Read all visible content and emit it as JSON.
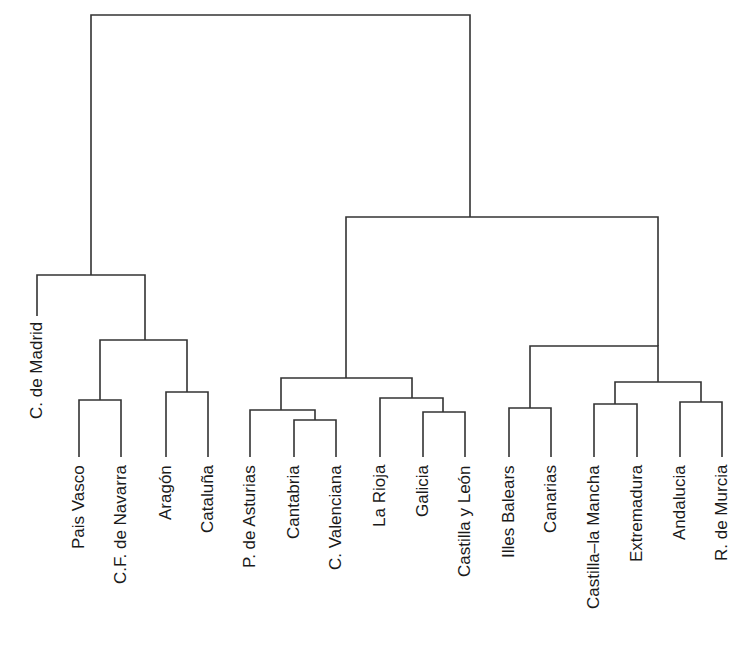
{
  "diagram": {
    "type": "dendrogram",
    "line_color": "#333333",
    "leaves": [
      {
        "label": "C. de Madrid",
        "x": 37,
        "top": 322,
        "bottom": 316
      },
      {
        "label": "Pais Vasco",
        "x": 79,
        "top": 465
      },
      {
        "label": "C.F. de Navarra",
        "x": 121,
        "top": 465
      },
      {
        "label": "Aragón",
        "x": 166,
        "top": 465
      },
      {
        "label": "Cataluña",
        "x": 208,
        "top": 465
      },
      {
        "label": "P. de Asturias",
        "x": 250,
        "top": 465
      },
      {
        "label": "Cantabria",
        "x": 294,
        "top": 465
      },
      {
        "label": "C. Valenciana",
        "x": 336,
        "top": 465
      },
      {
        "label": "La Rioja",
        "x": 380,
        "top": 465
      },
      {
        "label": "Galicia",
        "x": 423,
        "top": 465
      },
      {
        "label": "Castilla y León",
        "x": 465,
        "top": 465
      },
      {
        "label": "Illes Balears",
        "x": 509,
        "top": 465
      },
      {
        "label": "Canarias",
        "x": 551,
        "top": 465
      },
      {
        "label": "Castilla–la Mancha",
        "x": 594,
        "top": 465
      },
      {
        "label": "Extremadura",
        "x": 637,
        "top": 465
      },
      {
        "label": "Andalucia",
        "x": 680,
        "top": 465
      },
      {
        "label": "R. de Murcia",
        "x": 722,
        "top": 465
      }
    ],
    "merges": [
      {
        "left_x": 79,
        "left_y": 457,
        "right_x": 121,
        "right_y": 457,
        "y": 400
      },
      {
        "left_x": 166,
        "left_y": 457,
        "right_x": 208,
        "right_y": 457,
        "y": 392
      },
      {
        "left_x": 100,
        "left_y": 400,
        "right_x": 187,
        "right_y": 392,
        "y": 340
      },
      {
        "left_x": 37,
        "left_y": 316,
        "right_x": 145,
        "right_y": 340,
        "y": 275
      },
      {
        "left_x": 294,
        "left_y": 457,
        "right_x": 336,
        "right_y": 457,
        "y": 420
      },
      {
        "left_x": 250,
        "left_y": 457,
        "right_x": 315,
        "right_y": 420,
        "y": 410
      },
      {
        "left_x": 423,
        "left_y": 457,
        "right_x": 465,
        "right_y": 457,
        "y": 412
      },
      {
        "left_x": 380,
        "left_y": 457,
        "right_x": 443,
        "right_y": 412,
        "y": 398
      },
      {
        "left_x": 281,
        "left_y": 410,
        "right_x": 412,
        "right_y": 398,
        "y": 378
      },
      {
        "left_x": 509,
        "left_y": 457,
        "right_x": 551,
        "right_y": 457,
        "y": 408
      },
      {
        "left_x": 594,
        "left_y": 457,
        "right_x": 637,
        "right_y": 457,
        "y": 404
      },
      {
        "left_x": 680,
        "left_y": 457,
        "right_x": 722,
        "right_y": 457,
        "y": 402
      },
      {
        "left_x": 615,
        "left_y": 404,
        "right_x": 701,
        "right_y": 402,
        "y": 382
      },
      {
        "left_x": 530,
        "left_y": 408,
        "right_x": 658,
        "right_y": 382,
        "y": 346
      },
      {
        "left_x": 346,
        "left_y": 378,
        "right_x": 658,
        "right_y": 346,
        "y": 217
      },
      {
        "left_x": 91,
        "left_y": 275,
        "right_x": 470,
        "right_y": 217,
        "y": 15
      }
    ]
  }
}
